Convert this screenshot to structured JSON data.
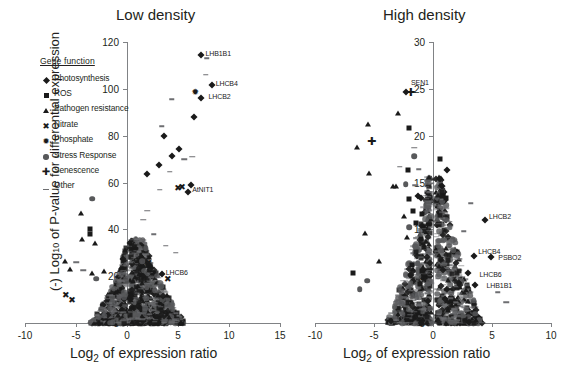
{
  "figure": {
    "y_axis_label": "(-) Log10 of P-value for differential expression",
    "caption": ""
  },
  "legend": {
    "title": "Gene function",
    "items": [
      {
        "label": "Photosynthesis",
        "symbol": "diamond"
      },
      {
        "label": "ROS",
        "symbol": "square"
      },
      {
        "label": "Pathogen resistance",
        "symbol": "triangle"
      },
      {
        "label": "Nitrate",
        "symbol": "cross"
      },
      {
        "label": "Phosphate",
        "symbol": "star"
      },
      {
        "label": "Stress Response",
        "symbol": "circle"
      },
      {
        "label": "Senescence",
        "symbol": "plus"
      },
      {
        "label": "Other",
        "symbol": "dash"
      }
    ]
  },
  "chart_data": [
    {
      "type": "scatter",
      "title": "Low density",
      "xlabel": "Log2 of expression ratio",
      "ylabel": "(-) Log10 of P-value for differential expression",
      "xlim": [
        -10,
        15
      ],
      "ylim": [
        0,
        120
      ],
      "xticks": [
        -10,
        -5,
        0,
        5,
        10,
        15
      ],
      "yticks": [
        0,
        20,
        40,
        60,
        80,
        100,
        120
      ],
      "grid": false,
      "legend_position": "upper-left",
      "annotations": [
        {
          "text": "LHB1B1",
          "x": 7.3,
          "y": 115.0
        },
        {
          "text": "LHCB4",
          "x": 8.3,
          "y": 102.0
        },
        {
          "text": "LHCB2",
          "x": 7.6,
          "y": 96.5
        },
        {
          "text": "AtNIT1",
          "x": 6.0,
          "y": 57.0
        },
        {
          "text": "LHCB6",
          "x": 3.4,
          "y": 21.5
        }
      ],
      "points": [
        {
          "x": 7.3,
          "y": 114.5,
          "symbol": "diamond"
        },
        {
          "x": 7.8,
          "y": 113.0,
          "symbol": "dash"
        },
        {
          "x": 8.3,
          "y": 101.5,
          "symbol": "diamond"
        },
        {
          "x": 7.7,
          "y": 106.0,
          "symbol": "dash"
        },
        {
          "x": 6.7,
          "y": 98.5,
          "symbol": "star"
        },
        {
          "x": 7.3,
          "y": 96.0,
          "symbol": "diamond"
        },
        {
          "x": 6.6,
          "y": 88.0,
          "symbol": "diamond"
        },
        {
          "x": 4.4,
          "y": 95.5,
          "symbol": "dash"
        },
        {
          "x": 3.6,
          "y": 80.0,
          "symbol": "diamond"
        },
        {
          "x": 3.4,
          "y": 84.0,
          "symbol": "dash"
        },
        {
          "x": 5.1,
          "y": 74.5,
          "symbol": "diamond"
        },
        {
          "x": 4.4,
          "y": 71.5,
          "symbol": "diamond"
        },
        {
          "x": 5.6,
          "y": 70.0,
          "symbol": "dash"
        },
        {
          "x": 6.4,
          "y": 71.0,
          "symbol": "dash"
        },
        {
          "x": 3.1,
          "y": 67.5,
          "symbol": "diamond"
        },
        {
          "x": 2.0,
          "y": 63.5,
          "symbol": "diamond"
        },
        {
          "x": 4.2,
          "y": 64.5,
          "symbol": "dash"
        },
        {
          "x": 5.4,
          "y": 58.0,
          "symbol": "cross"
        },
        {
          "x": 6.3,
          "y": 59.0,
          "symbol": "diamond"
        },
        {
          "x": 3.2,
          "y": 57.0,
          "symbol": "dash"
        },
        {
          "x": -3.4,
          "y": 53.0,
          "symbol": "circle"
        },
        {
          "x": -4.5,
          "y": 47.0,
          "symbol": "triangle"
        },
        {
          "x": -3.6,
          "y": 40.0,
          "symbol": "square"
        },
        {
          "x": -3.6,
          "y": 38.0,
          "symbol": "square"
        },
        {
          "x": -4.4,
          "y": 36.0,
          "symbol": "triangle"
        },
        {
          "x": -3.1,
          "y": 34.0,
          "symbol": "triangle"
        },
        {
          "x": -6.1,
          "y": 26.5,
          "symbol": "triangle"
        },
        {
          "x": -5.6,
          "y": 23.0,
          "symbol": "triangle"
        },
        {
          "x": -5.0,
          "y": 26.0,
          "symbol": "dash"
        },
        {
          "x": -4.3,
          "y": 22.5,
          "symbol": "dash"
        },
        {
          "x": -3.4,
          "y": 21.5,
          "symbol": "triangle"
        },
        {
          "x": -3.0,
          "y": 19.0,
          "symbol": "circle"
        },
        {
          "x": -2.3,
          "y": 22.0,
          "symbol": "triangle"
        },
        {
          "x": -6.0,
          "y": 12.0,
          "symbol": "cross"
        },
        {
          "x": -5.4,
          "y": 10.0,
          "symbol": "cross"
        },
        {
          "x": 2.1,
          "y": 25.5,
          "symbol": "cross"
        },
        {
          "x": 3.4,
          "y": 21.0,
          "symbol": "diamond"
        },
        {
          "x": 4.0,
          "y": 19.0,
          "symbol": "cross"
        },
        {
          "x": 6.0,
          "y": 56.0,
          "symbol": "diamond"
        },
        {
          "x": 5.0,
          "y": 57.5,
          "symbol": "cross"
        },
        {
          "x": 1.6,
          "y": 44.0,
          "symbol": "dash"
        },
        {
          "x": 2.6,
          "y": 38.0,
          "symbol": "dash"
        },
        {
          "x": 3.8,
          "y": 33.0,
          "symbol": "dash"
        },
        {
          "x": 4.8,
          "y": 30.0,
          "symbol": "dash"
        },
        {
          "x": 2.0,
          "y": 48.0,
          "symbol": "dash"
        }
      ]
    },
    {
      "type": "scatter",
      "title": "High density",
      "xlabel": "Log2 of expression ratio",
      "ylabel": "(-) Log10 of P-value for differential expression",
      "xlim": [
        -10,
        10
      ],
      "ylim": [
        0,
        30
      ],
      "xticks": [
        -10,
        -5,
        0,
        5,
        10
      ],
      "yticks": [
        0,
        5,
        10,
        15,
        20,
        25,
        30
      ],
      "grid": false,
      "legend_position": "none",
      "annotations": [
        {
          "text": "SEN1",
          "x": -2.2,
          "y": 25.6
        },
        {
          "text": "LHCB2",
          "x": 4.4,
          "y": 11.3
        },
        {
          "text": "LHCB4",
          "x": 3.5,
          "y": 7.6
        },
        {
          "text": "PSBO2",
          "x": 5.2,
          "y": 6.9
        },
        {
          "text": "LHCB6",
          "x": 3.6,
          "y": 5.1
        },
        {
          "text": "LHB1B1",
          "x": 4.2,
          "y": 4.0
        }
      ],
      "points": [
        {
          "x": -2.3,
          "y": 24.7,
          "symbol": "diamond"
        },
        {
          "x": -1.9,
          "y": 24.7,
          "symbol": "plus"
        },
        {
          "x": -3.0,
          "y": 22.4,
          "symbol": "triangle"
        },
        {
          "x": -2.0,
          "y": 20.8,
          "symbol": "square"
        },
        {
          "x": -5.5,
          "y": 21.2,
          "symbol": "triangle"
        },
        {
          "x": -6.4,
          "y": 18.8,
          "symbol": "triangle"
        },
        {
          "x": -5.2,
          "y": 19.4,
          "symbol": "plus"
        },
        {
          "x": -1.6,
          "y": 17.8,
          "symbol": "circle"
        },
        {
          "x": -1.6,
          "y": 18.7,
          "symbol": "dash"
        },
        {
          "x": -2.1,
          "y": 16.3,
          "symbol": "square"
        },
        {
          "x": -2.8,
          "y": 16.7,
          "symbol": "dash"
        },
        {
          "x": -1.2,
          "y": 16.4,
          "symbol": "dash"
        },
        {
          "x": -5.4,
          "y": 16.0,
          "symbol": "triangle"
        },
        {
          "x": -3.1,
          "y": 14.6,
          "symbol": "triangle"
        },
        {
          "x": -3.4,
          "y": 14.6,
          "symbol": "triangle"
        },
        {
          "x": -2.3,
          "y": 14.8,
          "symbol": "circle"
        },
        {
          "x": -1.5,
          "y": 14.7,
          "symbol": "dash"
        },
        {
          "x": -2.0,
          "y": 13.2,
          "symbol": "square"
        },
        {
          "x": -1.3,
          "y": 13.6,
          "symbol": "diamond"
        },
        {
          "x": -1.0,
          "y": 13.3,
          "symbol": "diamond"
        },
        {
          "x": -1.7,
          "y": 12.0,
          "symbol": "square"
        },
        {
          "x": -2.5,
          "y": 11.4,
          "symbol": "triangle"
        },
        {
          "x": -0.9,
          "y": 11.6,
          "symbol": "square"
        },
        {
          "x": -1.4,
          "y": 10.7,
          "symbol": "square"
        },
        {
          "x": -2.0,
          "y": 10.2,
          "symbol": "circle"
        },
        {
          "x": -5.8,
          "y": 9.6,
          "symbol": "triangle"
        },
        {
          "x": -2.2,
          "y": 9.2,
          "symbol": "triangle"
        },
        {
          "x": -1.0,
          "y": 9.0,
          "symbol": "square"
        },
        {
          "x": -1.5,
          "y": 8.2,
          "symbol": "circle"
        },
        {
          "x": -4.6,
          "y": 6.6,
          "symbol": "triangle"
        },
        {
          "x": -1.8,
          "y": 6.2,
          "symbol": "square"
        },
        {
          "x": -1.3,
          "y": 6.4,
          "symbol": "circle"
        },
        {
          "x": -0.9,
          "y": 5.6,
          "symbol": "square"
        },
        {
          "x": -6.8,
          "y": 5.3,
          "symbol": "square"
        },
        {
          "x": -5.6,
          "y": 4.5,
          "symbol": "circle"
        },
        {
          "x": -6.2,
          "y": 3.6,
          "symbol": "circle"
        },
        {
          "x": -1.1,
          "y": 4.2,
          "symbol": "square"
        },
        {
          "x": 4.4,
          "y": 11.0,
          "symbol": "diamond"
        },
        {
          "x": 3.5,
          "y": 7.2,
          "symbol": "diamond"
        },
        {
          "x": 4.9,
          "y": 7.0,
          "symbol": "diamond"
        },
        {
          "x": 3.0,
          "y": 5.3,
          "symbol": "diamond"
        },
        {
          "x": 3.6,
          "y": 4.1,
          "symbol": "diamond"
        },
        {
          "x": 2.2,
          "y": 4.3,
          "symbol": "diamond"
        },
        {
          "x": 2.0,
          "y": 7.1,
          "symbol": "dash"
        },
        {
          "x": 1.4,
          "y": 10.8,
          "symbol": "dash"
        },
        {
          "x": 2.6,
          "y": 9.8,
          "symbol": "dash"
        },
        {
          "x": 3.2,
          "y": 12.8,
          "symbol": "dash"
        },
        {
          "x": 1.1,
          "y": 13.3,
          "symbol": "square"
        },
        {
          "x": 0.8,
          "y": 14.6,
          "symbol": "diamond"
        },
        {
          "x": 1.2,
          "y": 16.3,
          "symbol": "diamond"
        },
        {
          "x": 0.6,
          "y": 17.5,
          "symbol": "square"
        },
        {
          "x": 5.5,
          "y": 3.3,
          "symbol": "dash"
        },
        {
          "x": 6.2,
          "y": 2.2,
          "symbol": "dash"
        }
      ]
    }
  ]
}
